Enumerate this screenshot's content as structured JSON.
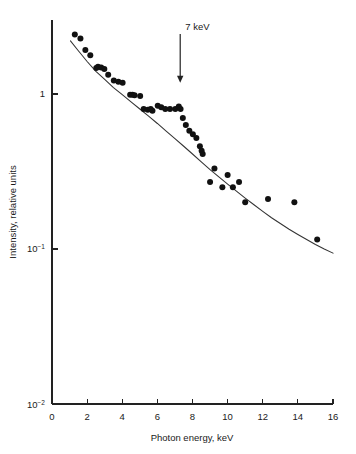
{
  "chart_data": {
    "type": "scatter",
    "title": "",
    "xlabel": "Photon energy, keV",
    "ylabel": "Intensity, relative units",
    "xlim": [
      0,
      16
    ],
    "ylim": [
      0.01,
      3
    ],
    "yscale": "log",
    "xscale": "linear",
    "grid": false,
    "legend": null,
    "xticks": [
      0,
      2,
      4,
      6,
      8,
      10,
      12,
      14,
      16
    ],
    "xticklabels": [
      "0",
      "2",
      "4",
      "6",
      "8",
      "10",
      "12",
      "14",
      "16"
    ],
    "yticks": [
      1,
      0.1,
      0.01
    ],
    "yticklabels": [
      "1",
      "10⁻¹",
      "10⁻²"
    ],
    "ytick_mantissa": [
      "1",
      "10",
      "10"
    ],
    "ytick_exponent": [
      "",
      "-1",
      "-2"
    ],
    "annotations": [
      {
        "text": "7 keV",
        "x": 7.3,
        "y_text": 2.55,
        "y_tip": 1.18,
        "arrow": "down"
      }
    ],
    "series": [
      {
        "name": "measured spectrum",
        "type": "scatter",
        "marker": "filled-circle",
        "marker_size_px": 3.0,
        "color": "#111111",
        "points": [
          [
            1.3,
            2.42
          ],
          [
            1.62,
            2.28
          ],
          [
            1.9,
            1.92
          ],
          [
            2.18,
            1.78
          ],
          [
            2.52,
            1.47
          ],
          [
            2.62,
            1.5
          ],
          [
            2.8,
            1.48
          ],
          [
            2.98,
            1.45
          ],
          [
            3.2,
            1.33
          ],
          [
            3.52,
            1.22
          ],
          [
            3.78,
            1.2
          ],
          [
            4.02,
            1.18
          ],
          [
            4.45,
            0.99
          ],
          [
            4.58,
            0.99
          ],
          [
            4.7,
            0.98
          ],
          [
            5.02,
            0.97
          ],
          [
            5.22,
            0.8
          ],
          [
            5.45,
            0.79
          ],
          [
            5.62,
            0.8
          ],
          [
            5.72,
            0.78
          ],
          [
            6.02,
            0.84
          ],
          [
            6.22,
            0.82
          ],
          [
            6.45,
            0.8
          ],
          [
            6.72,
            0.8
          ],
          [
            7.02,
            0.8
          ],
          [
            7.22,
            0.83
          ],
          [
            7.32,
            0.8
          ],
          [
            7.45,
            0.7
          ],
          [
            7.62,
            0.63
          ],
          [
            7.82,
            0.58
          ],
          [
            8.02,
            0.55
          ],
          [
            8.22,
            0.52
          ],
          [
            8.42,
            0.46
          ],
          [
            8.52,
            0.43
          ],
          [
            8.58,
            0.41
          ],
          [
            9.0,
            0.27
          ],
          [
            9.25,
            0.33
          ],
          [
            9.7,
            0.25
          ],
          [
            10.0,
            0.3
          ],
          [
            10.3,
            0.25
          ],
          [
            10.65,
            0.27
          ],
          [
            11.0,
            0.2
          ],
          [
            12.3,
            0.21
          ],
          [
            13.8,
            0.2
          ],
          [
            15.1,
            0.115
          ]
        ]
      },
      {
        "name": "fitted curve",
        "type": "line",
        "color": "#333333",
        "points": [
          [
            1.05,
            2.2
          ],
          [
            1.5,
            1.9
          ],
          [
            2.0,
            1.62
          ],
          [
            2.5,
            1.4
          ],
          [
            3.0,
            1.24
          ],
          [
            3.5,
            1.1
          ],
          [
            4.0,
            0.99
          ],
          [
            4.5,
            0.89
          ],
          [
            5.0,
            0.8
          ],
          [
            5.5,
            0.72
          ],
          [
            6.0,
            0.645
          ],
          [
            6.5,
            0.575
          ],
          [
            7.0,
            0.515
          ],
          [
            7.5,
            0.46
          ],
          [
            8.0,
            0.41
          ],
          [
            8.5,
            0.365
          ],
          [
            9.0,
            0.325
          ],
          [
            9.5,
            0.292
          ],
          [
            10.0,
            0.262
          ],
          [
            10.5,
            0.236
          ],
          [
            11.0,
            0.213
          ],
          [
            11.5,
            0.193
          ],
          [
            12.0,
            0.175
          ],
          [
            12.5,
            0.159
          ],
          [
            13.0,
            0.146
          ],
          [
            13.5,
            0.134
          ],
          [
            14.0,
            0.124
          ],
          [
            14.5,
            0.115
          ],
          [
            15.0,
            0.107
          ],
          [
            15.5,
            0.1
          ],
          [
            16.0,
            0.094
          ]
        ]
      }
    ]
  }
}
